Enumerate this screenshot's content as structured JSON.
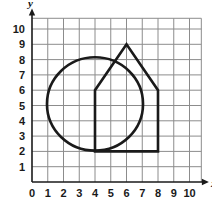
{
  "chart_data": {
    "type": "scatter",
    "title": "",
    "xlabel": "x",
    "ylabel": "y",
    "xlim": [
      0,
      10.8
    ],
    "ylim": [
      0,
      10.7
    ],
    "grid": true,
    "legend": "none",
    "x_ticks": [
      "0",
      "1",
      "2",
      "3",
      "4",
      "5",
      "6",
      "7",
      "8",
      "9",
      "10"
    ],
    "y_ticks": [
      "1",
      "2",
      "3",
      "4",
      "5",
      "6",
      "7",
      "8",
      "9",
      "10"
    ],
    "x_tick_values": [
      0,
      1,
      2,
      3,
      4,
      5,
      6,
      7,
      8,
      9,
      10
    ],
    "y_tick_values": [
      1,
      2,
      3,
      4,
      5,
      6,
      7,
      8,
      9,
      10
    ],
    "shapes": [
      {
        "name": "circle",
        "type": "circle",
        "center": [
          4,
          5.1
        ],
        "radius": 3.05,
        "stroke": "#1a1a1a",
        "fill": "none"
      },
      {
        "name": "house-pentagon",
        "type": "polygon",
        "vertices": [
          [
            4,
            2
          ],
          [
            4,
            6
          ],
          [
            6,
            9
          ],
          [
            8,
            6
          ],
          [
            8,
            2
          ]
        ],
        "closed": true,
        "stroke": "#1a1a1a",
        "fill": "none"
      }
    ],
    "colors": {
      "grid": "#8c8c8c",
      "axis": "#1a1a1a",
      "shape_stroke": "#1a1a1a",
      "background": "#ffffff"
    }
  },
  "axis_labels": {
    "x": "x",
    "y": "y"
  }
}
